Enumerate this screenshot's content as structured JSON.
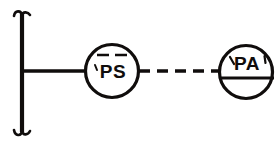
{
  "diagram": {
    "background_color": "#ffffff",
    "line_color": "#100d0c",
    "bus": {
      "name": "vertical-bus-bar",
      "x": 22,
      "y_top": 12,
      "y_bottom": 134,
      "stroke_width": 4.2,
      "hook_top_label": "top serif hook",
      "hook_bottom_label": "bottom serif hook"
    },
    "connections": [
      {
        "name": "solid-signal-line",
        "style": "solid",
        "from": "vertical-bus-bar",
        "to": "ps-bubble",
        "x1": 22,
        "x2": 86,
        "y": 71,
        "stroke_width": 3.4
      },
      {
        "name": "dashed-signal-line",
        "style": "dashed",
        "from": "ps-bubble",
        "to": "pa-bubble",
        "x1": 139,
        "x2": 220,
        "y": 71,
        "stroke_width": 3.4,
        "dash_pattern": "11 7"
      }
    ],
    "bubbles": [
      {
        "id": "ps-bubble",
        "name": "ps-instrument-bubble",
        "label": "PS",
        "tag_meaning": "Pressure Switch",
        "cx": 112,
        "cy": 71,
        "r": 26.5,
        "stroke_width": 3.2,
        "text_x": 113,
        "text_y": 78,
        "marker": {
          "type": "dashed-overline",
          "name": "ps-dashed-overline",
          "y": 55,
          "x1": 97,
          "x2": 129,
          "dash_pattern": "12 6",
          "stroke_width": 2.6
        },
        "tick": {
          "name": "ps-left-tick",
          "x1": 95,
          "y1": 66,
          "x2": 97,
          "y2": 70,
          "stroke_width": 2
        }
      },
      {
        "id": "pa-bubble",
        "name": "pa-instrument-bubble",
        "label": "PA",
        "tag_meaning": "Pressure Alarm",
        "cx": 246,
        "cy": 72,
        "r": 26.5,
        "stroke_width": 3.2,
        "text_x": 247,
        "text_y": 70,
        "marker": {
          "type": "solid-chord-line",
          "name": "pa-horizontal-divider",
          "y": 78,
          "x1": 219,
          "x2": 274,
          "stroke_width": 3.2
        },
        "tick_left": {
          "name": "pa-left-tick",
          "x1": 230,
          "y1": 58,
          "x2": 234,
          "y2": 64,
          "stroke_width": 2.2
        },
        "tick_right": {
          "name": "pa-right-tick",
          "x1": 264,
          "y1": 56,
          "x2": 265,
          "y2": 62,
          "stroke_width": 2.2
        }
      }
    ]
  }
}
